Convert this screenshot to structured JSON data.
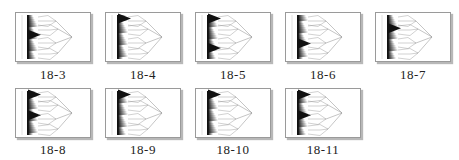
{
  "figure": {
    "panels": [
      {
        "label": "18-3",
        "big_wedges": [
          0.45
        ],
        "col": 0,
        "row": 0
      },
      {
        "label": "18-4",
        "big_wedges": [
          0.08
        ],
        "col": 1,
        "row": 0
      },
      {
        "label": "18-5",
        "big_wedges": [
          0.08,
          0.75
        ],
        "col": 2,
        "row": 0
      },
      {
        "label": "18-6",
        "big_wedges": [
          0.65
        ],
        "col": 3,
        "row": 0
      },
      {
        "label": "18-7",
        "big_wedges": [
          0.3
        ],
        "col": 4,
        "row": 0
      },
      {
        "label": "18-8",
        "big_wedges": [
          0.08,
          0.55
        ],
        "col": 0,
        "row": 1
      },
      {
        "label": "18-9",
        "big_wedges": [
          0.08
        ],
        "col": 1,
        "row": 1
      },
      {
        "label": "18-10",
        "big_wedges": [
          0.08
        ],
        "col": 2,
        "row": 1
      },
      {
        "label": "18-11",
        "big_wedges": [
          0.08,
          0.55
        ],
        "col": 3,
        "row": 1
      }
    ]
  },
  "colors": {
    "ink": "#111111",
    "line": "#8a8a8a",
    "frame": "#9a9a9a"
  }
}
